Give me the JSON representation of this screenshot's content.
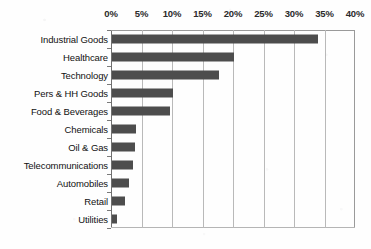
{
  "chart_data": {
    "type": "bar",
    "orientation": "horizontal",
    "title": "",
    "subtitle": "",
    "xlabel": "",
    "ylabel": "",
    "xlim": [
      0,
      40
    ],
    "xtick_labels": [
      "0%",
      "5%",
      "10%",
      "15%",
      "20%",
      "25%",
      "30%",
      "35%",
      "40%"
    ],
    "xtick_values": [
      0,
      5,
      10,
      15,
      20,
      25,
      30,
      35,
      40
    ],
    "grid": "vertical",
    "legend": "none",
    "units": "percent",
    "categories": [
      "Industrial Goods",
      "Healthcare",
      "Technology",
      "Pers & HH Goods",
      "Food & Beverages",
      "Chemicals",
      "Oil & Gas",
      "Telecommunications",
      "Automobiles",
      "Retail",
      "Utilities"
    ],
    "values": [
      33.8,
      20.0,
      17.5,
      10.0,
      9.5,
      4.0,
      3.7,
      3.4,
      2.8,
      2.2,
      0.9
    ],
    "series": [
      {
        "name": "Share",
        "values": [
          33.8,
          20.0,
          17.5,
          10.0,
          9.5,
          4.0,
          3.7,
          3.4,
          2.8,
          2.2,
          0.9
        ]
      }
    ],
    "colors": {
      "bar": "#4d4d4d",
      "gridline": "#b9b9b9",
      "axis": "#6f6f6f",
      "background": "#fefefe",
      "label_text": "#111111",
      "tick_text": "#2b2b2b"
    }
  }
}
